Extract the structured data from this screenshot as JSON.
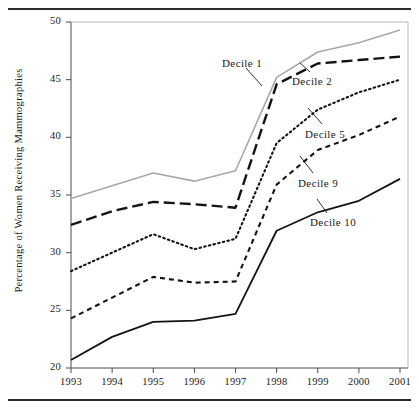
{
  "chart_data": {
    "type": "line",
    "title": "",
    "xlabel": "",
    "ylabel": "Percentage of Women Receiving Mammographies",
    "x": [
      1993,
      1994,
      1995,
      1996,
      1997,
      1998,
      1999,
      2000,
      2001
    ],
    "xtick_labels": [
      "1993",
      "1994",
      "1995",
      "1996",
      "1997",
      "1998",
      "1999",
      "2000",
      "2001"
    ],
    "ytick_labels": [
      "20",
      "25",
      "30",
      "35",
      "40",
      "45",
      "50"
    ],
    "yticks": [
      20,
      25,
      30,
      35,
      40,
      45,
      50
    ],
    "ylim": [
      20,
      50
    ],
    "xlim": [
      1993,
      2001
    ],
    "grid": false,
    "legend": "inline-annotations",
    "series": [
      {
        "name": "Decile 1",
        "style": "solid-gray",
        "color": "#a8a8a8",
        "values": [
          34.7,
          35.8,
          36.9,
          36.2,
          37.1,
          45.2,
          47.4,
          48.2,
          49.3
        ]
      },
      {
        "name": "Decile 2",
        "style": "long-dash",
        "color": "#141414",
        "values": [
          32.4,
          33.6,
          34.4,
          34.2,
          33.9,
          44.6,
          46.4,
          46.7,
          47.0
        ]
      },
      {
        "name": "Decile 5",
        "style": "dotted",
        "color": "#141414",
        "values": [
          28.4,
          30.0,
          31.6,
          30.3,
          31.2,
          39.5,
          42.4,
          43.9,
          45.0
        ]
      },
      {
        "name": "Decile 9",
        "style": "short-dash",
        "color": "#141414",
        "values": [
          24.3,
          26.1,
          27.9,
          27.4,
          27.5,
          35.9,
          38.9,
          40.2,
          41.8
        ]
      },
      {
        "name": "Decile 10",
        "style": "solid-black",
        "color": "#141414",
        "values": [
          20.7,
          22.7,
          24.0,
          24.1,
          24.7,
          31.9,
          33.5,
          34.5,
          36.4
        ]
      }
    ],
    "annotations": [
      {
        "label": "Decile 1",
        "text_x": 222,
        "text_y": 57,
        "leader_from": [
          246,
          68
        ],
        "leader_to": [
          262,
          86
        ]
      },
      {
        "label": "Decile 2",
        "text_x": 292,
        "text_y": 75,
        "leader_from": [
          310,
          72
        ],
        "leader_to": [
          300,
          63
        ]
      },
      {
        "label": "Decile 5",
        "text_x": 305,
        "text_y": 128,
        "leader_from": [
          322,
          124
        ],
        "leader_to": [
          308,
          108
        ]
      },
      {
        "label": "Decile 9",
        "text_x": 298,
        "text_y": 177,
        "leader_from": [
          313,
          173
        ],
        "leader_to": [
          300,
          156
        ]
      },
      {
        "label": "Decile 10",
        "text_x": 310,
        "text_y": 216,
        "leader_from": [
          327,
          213
        ],
        "leader_to": [
          317,
          199
        ]
      }
    ]
  }
}
